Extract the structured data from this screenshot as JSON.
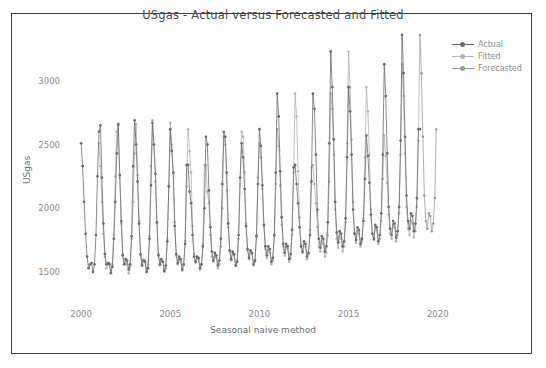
{
  "chart_data": {
    "type": "line",
    "title": "USgas - Actual versus Forecasted and Fitted",
    "xlabel": "Seasonal naive method",
    "ylabel": "USgas",
    "xlim": [
      1999.6,
      2020.8
    ],
    "ylim": [
      1280,
      3320
    ],
    "xticks": [
      2000,
      2005,
      2010,
      2015,
      2020
    ],
    "yticks": [
      1500,
      2000,
      2500,
      3000
    ],
    "grid": false,
    "legend_position": "top-right",
    "frequency": "monthly",
    "x_start": 2000.0,
    "x_end": 2019.0,
    "series": [
      {
        "name": "Actual",
        "color": "#6b6b6b",
        "marker": "circle",
        "description": "Observed monthly US natural gas consumption, Jan 2000 - Jan 2019, strong winter peaks and summer troughs with rising trend after 2012",
        "x": [
          2000.0,
          2000.083,
          2000.167,
          2000.25,
          2000.333,
          2000.417,
          2000.5,
          2000.583,
          2000.667,
          2000.75,
          2000.833,
          2000.917,
          2001.0,
          2001.083,
          2001.167,
          2001.25,
          2001.333,
          2001.417,
          2001.5,
          2001.583,
          2001.667,
          2001.75,
          2001.833,
          2001.917,
          2002.0,
          2002.083,
          2002.167,
          2002.25,
          2002.333,
          2002.417,
          2002.5,
          2002.583,
          2002.667,
          2002.75,
          2002.833,
          2002.917,
          2003.0,
          2003.083,
          2003.167,
          2003.25,
          2003.333,
          2003.417,
          2003.5,
          2003.583,
          2003.667,
          2003.75,
          2003.833,
          2003.917,
          2004.0,
          2004.083,
          2004.167,
          2004.25,
          2004.333,
          2004.417,
          2004.5,
          2004.583,
          2004.667,
          2004.75,
          2004.833,
          2004.917,
          2005.0,
          2005.083,
          2005.167,
          2005.25,
          2005.333,
          2005.417,
          2005.5,
          2005.583,
          2005.667,
          2005.75,
          2005.833,
          2005.917,
          2006.0,
          2006.083,
          2006.167,
          2006.25,
          2006.333,
          2006.417,
          2006.5,
          2006.583,
          2006.667,
          2006.75,
          2006.833,
          2006.917,
          2007.0,
          2007.083,
          2007.167,
          2007.25,
          2007.333,
          2007.417,
          2007.5,
          2007.583,
          2007.667,
          2007.75,
          2007.833,
          2007.917,
          2008.0,
          2008.083,
          2008.167,
          2008.25,
          2008.333,
          2008.417,
          2008.5,
          2008.583,
          2008.667,
          2008.75,
          2008.833,
          2008.917,
          2009.0,
          2009.083,
          2009.167,
          2009.25,
          2009.333,
          2009.417,
          2009.5,
          2009.583,
          2009.667,
          2009.75,
          2009.833,
          2009.917,
          2010.0,
          2010.083,
          2010.167,
          2010.25,
          2010.333,
          2010.417,
          2010.5,
          2010.583,
          2010.667,
          2010.75,
          2010.833,
          2010.917,
          2011.0,
          2011.083,
          2011.167,
          2011.25,
          2011.333,
          2011.417,
          2011.5,
          2011.583,
          2011.667,
          2011.75,
          2011.833,
          2011.917,
          2012.0,
          2012.083,
          2012.167,
          2012.25,
          2012.333,
          2012.417,
          2012.5,
          2012.583,
          2012.667,
          2012.75,
          2012.833,
          2012.917,
          2013.0,
          2013.083,
          2013.167,
          2013.25,
          2013.333,
          2013.417,
          2013.5,
          2013.583,
          2013.667,
          2013.75,
          2013.833,
          2013.917,
          2014.0,
          2014.083,
          2014.167,
          2014.25,
          2014.333,
          2014.417,
          2014.5,
          2014.583,
          2014.667,
          2014.75,
          2014.833,
          2014.917,
          2015.0,
          2015.083,
          2015.167,
          2015.25,
          2015.333,
          2015.417,
          2015.5,
          2015.583,
          2015.667,
          2015.75,
          2015.833,
          2015.917,
          2016.0,
          2016.083,
          2016.167,
          2016.25,
          2016.333,
          2016.417,
          2016.5,
          2016.583,
          2016.667,
          2016.75,
          2016.833,
          2016.917,
          2017.0,
          2017.083,
          2017.167,
          2017.25,
          2017.333,
          2017.417,
          2017.5,
          2017.583,
          2017.667,
          2017.75,
          2017.833,
          2017.917,
          2018.0,
          2018.083,
          2018.167,
          2018.25,
          2018.333,
          2018.417,
          2018.5,
          2018.583,
          2018.667,
          2018.75,
          2018.833,
          2018.917,
          2019.0
        ],
        "y": [
          2510,
          2330,
          2050,
          1800,
          1620,
          1530,
          1560,
          1570,
          1500,
          1560,
          1790,
          2250,
          2600,
          2650,
          2240,
          1880,
          1640,
          1560,
          1570,
          1560,
          1490,
          1540,
          1760,
          2050,
          2430,
          2660,
          2260,
          1900,
          1630,
          1560,
          1600,
          1590,
          1520,
          1560,
          1780,
          2330,
          2690,
          2500,
          2210,
          1880,
          1640,
          1550,
          1590,
          1580,
          1500,
          1530,
          1760,
          2180,
          2670,
          2500,
          2270,
          1890,
          1630,
          1560,
          1600,
          1580,
          1510,
          1550,
          1740,
          2170,
          2620,
          2450,
          2280,
          1860,
          1640,
          1570,
          1620,
          1600,
          1520,
          1560,
          1720,
          2340,
          2340,
          2130,
          2040,
          1790,
          1620,
          1580,
          1620,
          1610,
          1530,
          1560,
          1700,
          2000,
          2560,
          2500,
          2140,
          1850,
          1660,
          1590,
          1650,
          1630,
          1550,
          1590,
          1760,
          2190,
          2600,
          2560,
          2280,
          1880,
          1670,
          1600,
          1660,
          1640,
          1550,
          1580,
          1790,
          2240,
          2510,
          2400,
          2150,
          1860,
          1680,
          1610,
          1670,
          1650,
          1560,
          1590,
          1780,
          2190,
          2620,
          2490,
          2180,
          1870,
          1700,
          1630,
          1700,
          1680,
          1580,
          1610,
          1790,
          2280,
          2900,
          2720,
          2290,
          1930,
          1720,
          1650,
          1720,
          1700,
          1600,
          1640,
          1830,
          2320,
          2340,
          2190,
          2040,
          1850,
          1700,
          1660,
          1740,
          1720,
          1620,
          1650,
          1790,
          2210,
          2900,
          2780,
          2420,
          1990,
          1760,
          1690,
          1780,
          1760,
          1660,
          1700,
          1890,
          2510,
          3230,
          2950,
          2540,
          2050,
          1810,
          1730,
          1820,
          1800,
          1700,
          1740,
          1920,
          2400,
          2950,
          2760,
          2420,
          1990,
          1800,
          1750,
          1850,
          1830,
          1720,
          1760,
          1900,
          2230,
          2570,
          2410,
          2200,
          1950,
          1800,
          1760,
          1870,
          1850,
          1740,
          1790,
          1960,
          2420,
          3130,
          2880,
          2430,
          2010,
          1840,
          1790,
          1900,
          1880,
          1770,
          1820,
          2010,
          2530,
          3360,
          3060,
          2560,
          2100,
          1900,
          1840,
          1960,
          1940,
          1820,
          1880,
          2080,
          2620,
          2620
        ]
      },
      {
        "name": "Fitted",
        "color": "#b3b3b3",
        "marker": "circle",
        "description": "Seasonal naive in-sample fit: value of the same month one year earlier, Jan 2001 onward",
        "lag_months": 12
      },
      {
        "name": "Forecasted",
        "color": "#9a9a9a",
        "marker": "circle",
        "description": "Seasonal naive out-of-sample forecast repeating the final observed seasonal cycle"
      }
    ]
  },
  "legend": {
    "items": [
      {
        "label": "Actual"
      },
      {
        "label": "Fitted"
      },
      {
        "label": "Forecasted"
      }
    ]
  },
  "axes": {
    "x_tick_labels": [
      "2000",
      "2005",
      "2010",
      "2015",
      "2020"
    ],
    "y_tick_labels": [
      "1500",
      "2000",
      "2500",
      "3000"
    ],
    "x_axis_title": "Seasonal naive method",
    "y_axis_title": "USgas"
  },
  "colors": {
    "actual": "#6b6b6b",
    "fitted": "#b3b3b3",
    "forecasted": "#9a9a9a",
    "frame": "#3a3a3a",
    "text": "#8a8a8a",
    "background": "#ffffff"
  }
}
